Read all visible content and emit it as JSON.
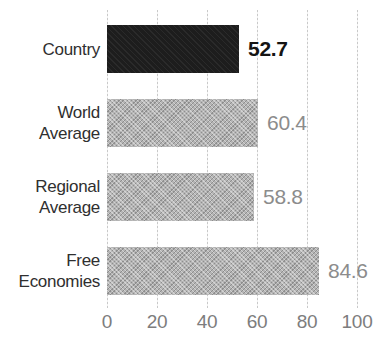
{
  "chart_data": {
    "type": "bar",
    "orientation": "horizontal",
    "title": "",
    "xlabel": "",
    "ylabel": "",
    "categories": [
      "Country",
      "World Average",
      "Regional Average",
      "Free Economies"
    ],
    "categories_multiline": [
      "Country",
      "World\nAverage",
      "Regional\nAverage",
      "Free\nEconomies"
    ],
    "values": [
      52.7,
      60.4,
      58.8,
      84.6
    ],
    "value_labels": [
      "52.7",
      "60.4",
      "58.8",
      "84.6"
    ],
    "highlight_category": "Country",
    "xlim": [
      0,
      100
    ],
    "x_ticks": [
      0,
      20,
      40,
      60,
      80,
      100
    ],
    "x_tick_labels": [
      "0",
      "20",
      "40",
      "60",
      "80",
      "100"
    ],
    "grid": true,
    "legend": false,
    "colors": {
      "highlight_bar": "#1d1d1d",
      "comparison_bar": "#b4b4b4",
      "highlight_value_text": "#141414",
      "comparison_value_text": "#8c8c8c",
      "category_label_text": "#2f2f2f",
      "tick_label_text": "#7d7d7d",
      "gridline": "#c9c9c9",
      "background": "#ffffff"
    }
  }
}
